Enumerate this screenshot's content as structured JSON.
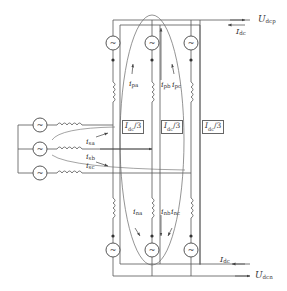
{
  "diagram": {
    "title": "",
    "labels": {
      "u_dcp": {
        "main": "U",
        "sub": "dcp"
      },
      "i_dc_top": {
        "main": "I",
        "sub": "dc"
      },
      "u_dcn": {
        "main": "U",
        "sub": "dcn"
      },
      "i_dc_bottom": {
        "main": "I",
        "sub": "dc"
      },
      "i_pa": {
        "main": "i",
        "sub": "pa"
      },
      "i_pb": {
        "main": "i",
        "sub": "pb"
      },
      "i_pc": {
        "main": "i",
        "sub": "pc"
      },
      "i_na": {
        "main": "i",
        "sub": "na"
      },
      "i_nb": {
        "main": "i",
        "sub": "nb"
      },
      "i_nc": {
        "main": "i",
        "sub": "nc"
      },
      "i_sa": {
        "main": "i",
        "sub": "sa"
      },
      "i_sb": {
        "main": "i",
        "sub": "sb"
      },
      "i_sc": {
        "main": "i",
        "sub": "sc"
      }
    },
    "boxes": [
      {
        "main": "I",
        "sub": "dc",
        "suffix": "/3"
      },
      {
        "main": "I",
        "sub": "dc",
        "suffix": "/3"
      },
      {
        "main": "I",
        "sub": "dc",
        "suffix": "/3"
      }
    ],
    "source_glyph": "~",
    "colors": {
      "line": "#555555",
      "text": "#333333"
    }
  }
}
